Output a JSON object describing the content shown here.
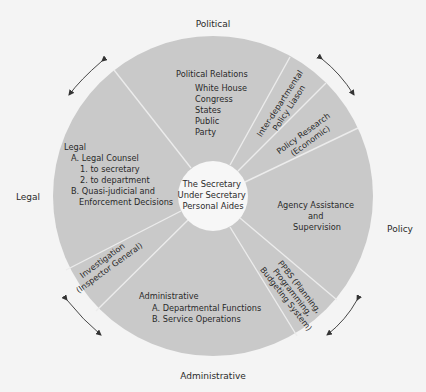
{
  "diagram": {
    "colors": {
      "background": "#f4f4f4",
      "disk": "#c9c9c9",
      "divider": "#ececec",
      "center": "#f7f7f7",
      "text": "#2a2a2a",
      "arrow": "#333333"
    },
    "outer_labels": {
      "top": "Political",
      "right": "Policy",
      "bottom": "Administrative",
      "left": "Legal"
    },
    "center": {
      "lines": [
        "The Secretary",
        "Under Secretary",
        "Personal Aides"
      ]
    },
    "segments": {
      "political_relations": {
        "title": "Political Relations",
        "items": [
          "White House",
          "Congress",
          "States",
          "Public",
          "Party"
        ]
      },
      "interdepartmental": {
        "lines": [
          "Inter-departmental",
          "Policy Liason"
        ]
      },
      "policy_research": {
        "lines": [
          "Policy Research",
          "(Economic)"
        ]
      },
      "agency_assistance": {
        "lines": [
          "Agency Assistance",
          "and",
          "Supervision"
        ]
      },
      "ppbs": {
        "lines": [
          "PPBS (Planning,",
          "Programming,",
          "Budgeting System)"
        ]
      },
      "administrative": {
        "title": "Administrative",
        "items": [
          "A. Departmental Functions",
          "B. Service Operations"
        ]
      },
      "investigation": {
        "lines": [
          "Investigation",
          "(Inspector General)"
        ]
      },
      "legal": {
        "title": "Legal",
        "items": [
          "A. Legal Counsel",
          "1.  to secretary",
          "2.  to department",
          "B. Quasi-judicial and",
          "Enforcement Decisions"
        ]
      }
    },
    "arrows": [
      "top-left",
      "top-right",
      "bottom-left",
      "bottom-right"
    ]
  }
}
